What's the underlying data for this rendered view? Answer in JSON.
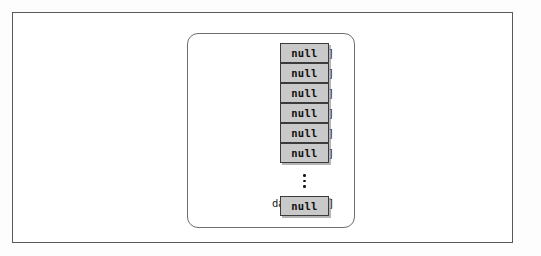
{
  "figure": {
    "background_color": "#fdfdfd",
    "outer_frame_color": "#5a5a5a",
    "panel_border_color": "#6d6d6d",
    "cell_fill_color": "#c9c9c9",
    "cell_border_color": "#3b3b3b",
    "text_color": "#1a1a1a"
  },
  "array": {
    "cell_value": "null",
    "rows": [
      {
        "label": "data[0]",
        "value": "null"
      },
      {
        "label": "data[1]",
        "value": "null"
      },
      {
        "label": "data[2]",
        "value": "null"
      },
      {
        "label": "data[3]",
        "value": "null"
      },
      {
        "label": "data[4]",
        "value": "null"
      },
      {
        "label": "data[5]",
        "value": "null"
      }
    ],
    "ellipsis": "⋮",
    "last_row": {
      "label_prefix": "data[",
      "label_var": "pk",
      "label_subscript": "max",
      "label_suffix": "]",
      "label_full": "data[pkmax]",
      "value": "null"
    }
  }
}
